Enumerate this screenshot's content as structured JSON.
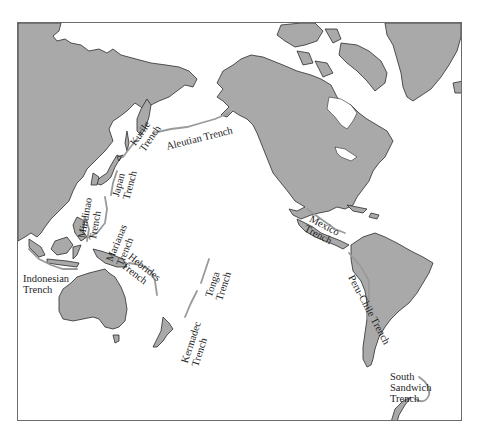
{
  "map": {
    "type": "world map, Pacific-centered",
    "colors": {
      "land": "#a9a9a9",
      "ocean": "#ffffff",
      "coastline": "#2c2c2c",
      "trench_line": "#9a9a9a",
      "frame": "#6b6b6b"
    },
    "trenches": [
      {
        "id": "aleutian",
        "line1": "Aleutian Trench"
      },
      {
        "id": "kurile",
        "line1": "Kurile",
        "line2": "Trench"
      },
      {
        "id": "japan",
        "line1": "Japan",
        "line2": "Trench"
      },
      {
        "id": "mindinao",
        "line1": "Mindinao",
        "line2": "Trench"
      },
      {
        "id": "marianas",
        "line1": "Marianas",
        "line2": "Trench"
      },
      {
        "id": "indonesian",
        "line1": "Indonesian",
        "line2": "Trench"
      },
      {
        "id": "hebrides",
        "line1": "Hebrides",
        "line2": "Trench"
      },
      {
        "id": "tonga",
        "line1": "Tonga",
        "line2": "Trench"
      },
      {
        "id": "kermadec",
        "line1": "Kermadec",
        "line2": "Trench"
      },
      {
        "id": "mexico",
        "line1": "Mexico",
        "line2": "Trench"
      },
      {
        "id": "peru-chile",
        "line1": "Peru-Chile Trench"
      },
      {
        "id": "south-sandwich",
        "line1": "South",
        "line2": "Sandwich",
        "line3": "Trench"
      }
    ]
  }
}
